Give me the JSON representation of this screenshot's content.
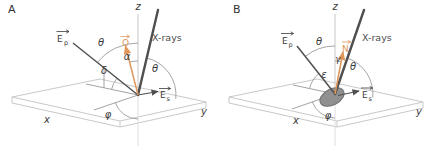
{
  "figure": {
    "background": "#ffffff",
    "colors": {
      "slab_gray": "#c9c9c9",
      "construction_gray": "#999999",
      "vector_dark": "#4f4f4f",
      "accent_orange": "#e0975c",
      "label_dark": "#3a3a3a",
      "disk_fill": "#909090"
    },
    "panel_a": {
      "panel_label": "A",
      "z_label": "z",
      "x_label": "x",
      "y_label": "y",
      "xrays_label": "X-rays",
      "ep_letter": "E",
      "ep_sub": "p",
      "es_letter": "E",
      "es_sub": "s",
      "normal_letter": "O",
      "angles": {
        "theta_polar": "θ",
        "alpha": "α",
        "delta": "δ",
        "theta_incidence": "θ",
        "phi": "φ"
      }
    },
    "panel_b": {
      "panel_label": "B",
      "z_label": "z",
      "x_label": "x",
      "y_label": "y",
      "xrays_label": "X-rays",
      "ep_letter": "E",
      "ep_sub": "p",
      "es_letter": "E",
      "es_sub": "s",
      "normal_letter": "N",
      "angles": {
        "theta_polar": "θ",
        "gamma": "γ",
        "epsilon": "ε",
        "theta_incidence": "θ",
        "phi": "φ"
      }
    }
  }
}
